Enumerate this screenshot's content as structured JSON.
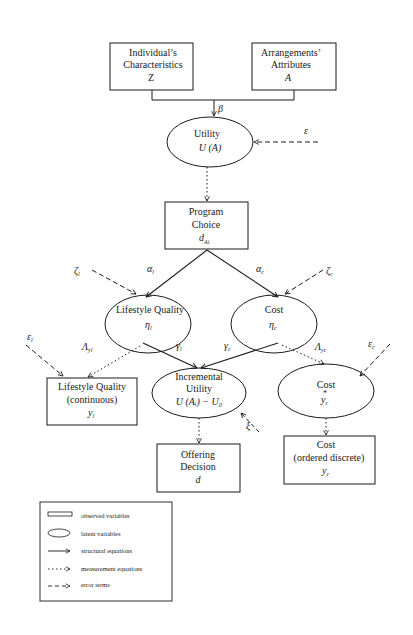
{
  "nodes": {
    "individual": {
      "line1": "Individual’s",
      "line2": "Characteristics",
      "symbol": "Z"
    },
    "arrangements": {
      "line1": "Arrangements’",
      "line2": "Attributes",
      "symbol": "A"
    },
    "utility": {
      "line1": "Utility",
      "symbol": "U (A)"
    },
    "program_choice": {
      "line1": "Program",
      "line2": "Choice",
      "symbol": "d",
      "subscript": "Ai"
    },
    "lifestyle_latent": {
      "line1": "Lifestyle Quality",
      "symbol": "η",
      "subscript": "l"
    },
    "cost_latent": {
      "line1": "Cost",
      "symbol": "η",
      "subscript": "c"
    },
    "lifestyle_observed": {
      "line1": "Lifestyle Quality",
      "line2": "(continuous)",
      "symbol": "y",
      "subscript": "l"
    },
    "incremental_utility": {
      "line1": "Incremental",
      "line2": "Utility",
      "symbol": "U (Aᵢ) − U₀"
    },
    "cost_star": {
      "line1": "Cost",
      "symbol": "y",
      "subscript": "c",
      "superscript": "*"
    },
    "offering_decision": {
      "line1": "Offering",
      "line2": "Decision",
      "symbol": "d"
    },
    "cost_observed": {
      "line1": "Cost",
      "line2": "(ordered discrete)",
      "symbol": "y",
      "subscript": "c"
    }
  },
  "edge_labels": {
    "beta": "β",
    "epsilon": "ε",
    "alpha_l": "α",
    "alpha_l_sub": "l",
    "alpha_c": "α",
    "alpha_c_sub": "c",
    "zeta_l": "ζ",
    "zeta_l_sub": "l",
    "zeta_c": "ζ",
    "zeta_c_sub": "c",
    "gamma_l": "γ",
    "gamma_l_sub": "l",
    "gamma_c": "γ",
    "gamma_c_sub": "c",
    "lambda_l": "Λ",
    "lambda_l_sub": "yl",
    "lambda_c": "Λ",
    "lambda_c_sub": "yc",
    "eps_l": "ε",
    "eps_l_sub": "l",
    "eps_c": "ε",
    "eps_c_sub": "c",
    "xi": "ξ"
  },
  "legend": {
    "items": [
      {
        "label": "observed variables",
        "shape": "rectangle"
      },
      {
        "label": "latent variables",
        "shape": "ellipse"
      },
      {
        "label": "structural equations",
        "shape": "solid-arrow"
      },
      {
        "label": "measurement equations",
        "shape": "dotted-arrow"
      },
      {
        "label": "error terms",
        "shape": "dashed-arrow"
      }
    ]
  },
  "colors": {
    "ink": "#1a1a1a",
    "background": "#ffffff"
  }
}
